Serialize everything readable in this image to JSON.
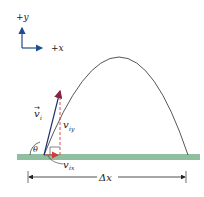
{
  "diagram": {
    "type": "projectile-motion",
    "axes": {
      "y_label": "+y",
      "x_label": "+x",
      "color": "#1f4e8c"
    },
    "trajectory": {
      "color": "#444444",
      "launch": [
        44,
        155
      ],
      "peak": [
        122,
        57
      ],
      "landing": [
        188,
        155
      ]
    },
    "ground": {
      "color": "#8fbf9f"
    },
    "vectors": {
      "initial_velocity": {
        "label": "v",
        "subscript": "i",
        "arrow_over": "→",
        "color": "#1f2f6e"
      },
      "vertical_component": {
        "label": "v",
        "subscript": "iy",
        "color": "#d43a3a"
      },
      "horizontal_component": {
        "label": "v",
        "subscript": "ix",
        "color": "#d43a3a"
      }
    },
    "angle": {
      "label": "θ"
    },
    "range": {
      "label": "Δx"
    }
  }
}
